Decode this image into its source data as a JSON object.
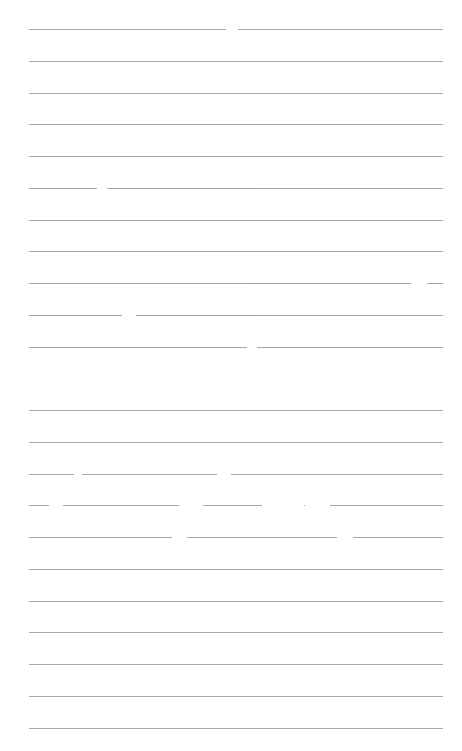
{
  "document": {
    "type": "ruled-paper",
    "line_color": "#9a9a9a",
    "background_color": "#ffffff",
    "sections": [
      {
        "name": "top-block",
        "line_count": 11
      },
      {
        "name": "bottom-block",
        "line_count": 11
      }
    ],
    "text_content": ""
  }
}
